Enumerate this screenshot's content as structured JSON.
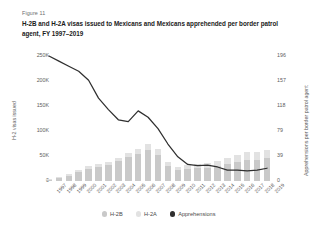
{
  "figure": {
    "number": "Figure 11",
    "title": "H-2B and H-2A visas issued to Mexicans and Mexicans apprehended per border patrol agent, FY 1997–2019"
  },
  "legend": {
    "items": [
      {
        "label": "H-2B",
        "color": "#c9c9c9",
        "marker": "circle-icon"
      },
      {
        "label": "H-2A",
        "color": "#e2e2e2",
        "marker": "circle-icon"
      },
      {
        "label": "Apprehensions",
        "color": "#2f2f2f",
        "marker": "circle-icon"
      }
    ]
  },
  "chart_data": {
    "type": "bar",
    "title": "H-2B and H-2A visas issued to Mexicans and Mexicans apprehended per border patrol agent, FY 1997–2019",
    "subtitle": "Figure 11",
    "xlabel": "",
    "ylabel": "H-2 visas issued",
    "y2label": "Apprehensions per border patrol agent",
    "grid": false,
    "legend_position": "bottom",
    "stacked": true,
    "categories": [
      "1997",
      "1998",
      "1999",
      "2000",
      "2001",
      "2002",
      "2003",
      "2004",
      "2005",
      "2006",
      "2007",
      "2008",
      "2009",
      "2010",
      "2011",
      "2012",
      "2013",
      "2014",
      "2015",
      "2016",
      "2017",
      "2018",
      "2019"
    ],
    "ylim": [
      0,
      250000
    ],
    "yticks": [
      0,
      50000,
      100000,
      150000,
      200000,
      250000
    ],
    "ytick_labels": [
      "0",
      "50K",
      "100K",
      "150K",
      "200K",
      "250K"
    ],
    "y2lim": [
      0,
      196
    ],
    "y2ticks": [
      0,
      39,
      79,
      118,
      157,
      196
    ],
    "y2tick_labels": [
      "0",
      "39",
      "79",
      "118",
      "157",
      "196"
    ],
    "series": [
      {
        "name": "H-2B",
        "axis": "left",
        "type": "bar",
        "color": "#c9c9c9",
        "values": [
          3000,
          6000,
          11000,
          18000,
          25000,
          29000,
          33000,
          40000,
          48000,
          55000,
          62000,
          52000,
          30000,
          22000,
          24000,
          26000,
          26000,
          30000,
          34000,
          38000,
          42000,
          43000,
          46000
        ]
      },
      {
        "name": "H-2A",
        "axis": "left",
        "type": "bar",
        "color": "#e2e2e2",
        "values": [
          1000,
          1500,
          2500,
          3500,
          4500,
          5000,
          5500,
          6500,
          7500,
          9000,
          13000,
          12000,
          8000,
          7000,
          8000,
          9000,
          10000,
          11000,
          13000,
          15000,
          17000,
          15000,
          17000
        ]
      },
      {
        "name": "Apprehensions",
        "axis": "right",
        "type": "line",
        "color": "#2f2f2f",
        "values": [
          196,
          188,
          180,
          172,
          158,
          130,
          112,
          96,
          93,
          110,
          100,
          82,
          58,
          38,
          26,
          24,
          25,
          22,
          17,
          17,
          16,
          17,
          20
        ]
      }
    ]
  }
}
